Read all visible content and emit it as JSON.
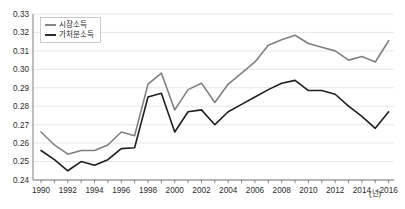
{
  "chart_data": {
    "type": "line",
    "title": "",
    "xlabel": "년",
    "ylabel": "",
    "x": [
      1990,
      1991,
      1992,
      1993,
      1994,
      1995,
      1996,
      1997,
      1998,
      1999,
      2000,
      2001,
      2002,
      2003,
      2004,
      2005,
      2006,
      2007,
      2008,
      2009,
      2010,
      2011,
      2012,
      2013,
      2014,
      2015,
      2016
    ],
    "xlim": [
      1989.4,
      2016.4
    ],
    "ylim": [
      0.24,
      0.33
    ],
    "yticks": [
      "0.24",
      "0.25",
      "0.26",
      "0.27",
      "0.28",
      "0.29",
      "0.30",
      "0.31",
      "0.32",
      "0.33"
    ],
    "ytick_values": [
      0.24,
      0.25,
      0.26,
      0.27,
      0.28,
      0.29,
      0.3,
      0.31,
      0.32,
      0.33
    ],
    "xticks": [
      "1990",
      "1992",
      "1994",
      "1996",
      "1998",
      "2000",
      "2002",
      "2004",
      "2006",
      "2008",
      "2010",
      "2012",
      "2014",
      "2016"
    ],
    "xtick_values": [
      1990,
      1992,
      1994,
      1996,
      1998,
      2000,
      2002,
      2004,
      2006,
      2008,
      2010,
      2012,
      2014,
      2016
    ],
    "x_axis_unit": "(년)",
    "grid": true,
    "legend_position": "top-left",
    "series": [
      {
        "name": "시장소득",
        "color": "#808080",
        "values": [
          0.266,
          0.259,
          0.254,
          0.256,
          0.256,
          0.259,
          0.266,
          0.264,
          0.292,
          0.298,
          0.278,
          0.289,
          0.2925,
          0.282,
          0.292,
          0.298,
          0.304,
          0.313,
          0.316,
          0.3185,
          0.314,
          0.312,
          0.31,
          0.305,
          0.307,
          0.304,
          0.3155
        ]
      },
      {
        "name": "가처분소득",
        "color": "#1f1f1f",
        "values": [
          0.256,
          0.251,
          0.245,
          0.25,
          0.248,
          0.251,
          0.257,
          0.2575,
          0.285,
          0.287,
          0.266,
          0.277,
          0.278,
          0.27,
          0.277,
          0.281,
          0.285,
          0.289,
          0.2925,
          0.294,
          0.2885,
          0.2885,
          0.2865,
          0.28,
          0.2745,
          0.268,
          0.277
        ]
      }
    ]
  },
  "legend": {
    "items": [
      {
        "label": "시장소득"
      },
      {
        "label": "가처분소득"
      }
    ]
  }
}
